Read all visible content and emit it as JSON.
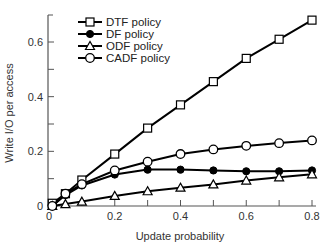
{
  "chart_data": {
    "type": "line",
    "title": "",
    "xlabel": "Update probability",
    "ylabel": "Write I/O per access",
    "xlim": [
      0,
      0.8
    ],
    "ylim": [
      0,
      0.7
    ],
    "xticks": [
      0,
      0.2,
      0.4,
      0.6,
      0.8
    ],
    "xtick_labels": [
      "0",
      "0.2",
      "0.4",
      "0.6",
      "0.8"
    ],
    "xminor_ticks": [
      0.1,
      0.3,
      0.5,
      0.7
    ],
    "yticks": [
      0,
      0.2,
      0.4,
      0.6
    ],
    "ytick_labels": [
      "0",
      "0.2",
      "0.4",
      "0.6"
    ],
    "yminor_ticks": [
      0.1,
      0.3,
      0.5
    ],
    "grid": false,
    "legend_position": "upper left",
    "x": [
      0.01,
      0.05,
      0.1,
      0.2,
      0.3,
      0.4,
      0.5,
      0.6,
      0.7,
      0.8
    ],
    "series": [
      {
        "name": "DTF policy",
        "marker": "open-square",
        "values": [
          0.01,
          0.045,
          0.095,
          0.19,
          0.285,
          0.37,
          0.455,
          0.54,
          0.61,
          0.68
        ]
      },
      {
        "name": "DF policy",
        "marker": "filled-circle",
        "values": [
          0.0,
          0.04,
          0.075,
          0.115,
          0.133,
          0.133,
          0.13,
          0.127,
          0.127,
          0.13
        ]
      },
      {
        "name": "ODF policy",
        "marker": "open-triangle",
        "values": [
          0.0,
          0.007,
          0.016,
          0.037,
          0.054,
          0.067,
          0.079,
          0.093,
          0.105,
          0.116
        ]
      },
      {
        "name": "CADF policy",
        "marker": "open-circle",
        "values": [
          0.0,
          0.045,
          0.08,
          0.13,
          0.162,
          0.19,
          0.207,
          0.22,
          0.23,
          0.24
        ]
      }
    ]
  },
  "colors": {
    "line": "#000000",
    "axis": "#555555",
    "text": "#333333",
    "background": "#ffffff"
  }
}
